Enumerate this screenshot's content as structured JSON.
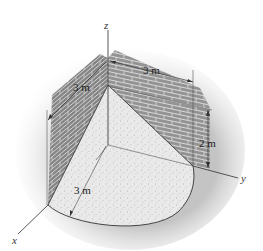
{
  "figure": {
    "type": "3D engineering diagram",
    "axes": {
      "x_label": "x",
      "y_label": "y",
      "z_label": "z"
    },
    "dimensions": {
      "top_along_y": "3 m",
      "left_along_x": "3 m",
      "wall_height_offset": "2 m",
      "base_radius": "3 m"
    },
    "colors": {
      "brick_wall": "#9a9a9a",
      "sand_fill": "#e6e6e6",
      "outline": "#333333",
      "shadow": "#cfcfcf"
    }
  }
}
